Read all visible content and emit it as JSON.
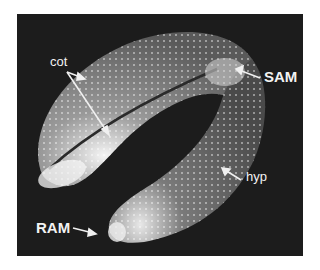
{
  "figure": {
    "background_color": "#1c1c1c",
    "labels": [
      {
        "id": "cot",
        "text": "cot"
      },
      {
        "id": "sam",
        "text": "SAM"
      },
      {
        "id": "hyp",
        "text": "hyp"
      },
      {
        "id": "ram",
        "text": "RAM"
      }
    ]
  }
}
